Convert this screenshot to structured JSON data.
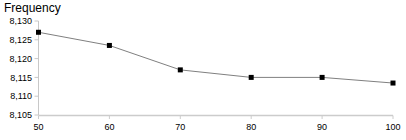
{
  "chart_data": {
    "type": "line",
    "title": "Frequency",
    "xlabel": "",
    "ylabel": "",
    "x": [
      50,
      60,
      70,
      80,
      90,
      100
    ],
    "values": [
      8127,
      8123.5,
      8117,
      8115,
      8115,
      8113.5
    ],
    "series": [
      {
        "name": "Frequency",
        "values": [
          8127,
          8123.5,
          8117,
          8115,
          8115,
          8113.5
        ]
      }
    ],
    "xlim": [
      50,
      100
    ],
    "ylim": [
      8105,
      8130
    ],
    "x_ticks": [
      "50",
      "60",
      "70",
      "80",
      "90",
      "100"
    ],
    "y_ticks": [
      "8,105",
      "8,110",
      "8,115",
      "8,120",
      "8,125",
      "8,130"
    ],
    "x_tick_values": [
      50,
      60,
      70,
      80,
      90,
      100
    ],
    "y_tick_values": [
      8105,
      8110,
      8115,
      8120,
      8125,
      8130
    ],
    "grid": false,
    "legend": "none",
    "marker": "square",
    "line_color": "#808080",
    "marker_color": "#000000",
    "axis_color": "#cccccc",
    "text_color": "#000000"
  }
}
